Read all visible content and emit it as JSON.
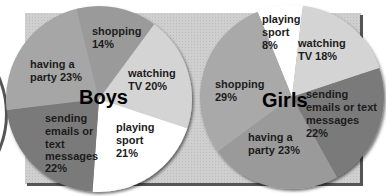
{
  "chart_data": [
    {
      "type": "pie",
      "title": "Boys",
      "categories": [
        "shopping",
        "watching TV",
        "playing sport",
        "sending emails or text messages",
        "having a party"
      ],
      "values": [
        14,
        20,
        21,
        22,
        23
      ],
      "colors": [
        "#9a9a9a",
        "#d4d4d4",
        "#ffffff",
        "#7a7a7a",
        "#a6a6a6"
      ],
      "labels": [
        {
          "lines": [
            "shopping",
            "14%"
          ]
        },
        {
          "lines": [
            "watching",
            "TV 20%"
          ]
        },
        {
          "lines": [
            "playing",
            "sport",
            "21%"
          ]
        },
        {
          "lines": [
            "sending",
            "emails or",
            "text",
            "messages",
            "22%"
          ]
        },
        {
          "lines": [
            "having a",
            "party 23%"
          ]
        }
      ]
    },
    {
      "type": "pie",
      "title": "Girls",
      "categories": [
        "playing sport",
        "watching TV",
        "sending emails or text messages",
        "having a party",
        "shopping"
      ],
      "values": [
        8,
        18,
        22,
        23,
        29
      ],
      "colors": [
        "#ffffff",
        "#d4d4d4",
        "#7a7a7a",
        "#9a9a9a",
        "#a9a9a9"
      ],
      "labels": [
        {
          "lines": [
            "playing",
            "sport",
            "8%"
          ]
        },
        {
          "lines": [
            "watching",
            "TV 18%"
          ]
        },
        {
          "lines": [
            "sending",
            "emails or text",
            "messages",
            "22%"
          ]
        },
        {
          "lines": [
            "having a",
            "party 23%"
          ]
        },
        {
          "lines": [
            "shopping",
            "29%"
          ]
        }
      ]
    }
  ],
  "boys": {
    "title": "Boys",
    "shopping": [
      "shopping",
      "14%"
    ],
    "tv": [
      "watching",
      "TV 20%"
    ],
    "sport": [
      "playing",
      "sport",
      "21%"
    ],
    "emails": [
      "sending",
      "emails or",
      "text",
      "messages",
      "22%"
    ],
    "party": [
      "having a",
      "party 23%"
    ]
  },
  "girls": {
    "title": "Girls",
    "sport": [
      "playing",
      "sport",
      "8%"
    ],
    "tv": [
      "watching",
      "TV 18%"
    ],
    "emails": [
      "sending",
      "emails or text",
      "messages",
      "22%"
    ],
    "party": [
      "having a",
      "party 23%"
    ],
    "shopping": [
      "shopping",
      "29%"
    ]
  }
}
